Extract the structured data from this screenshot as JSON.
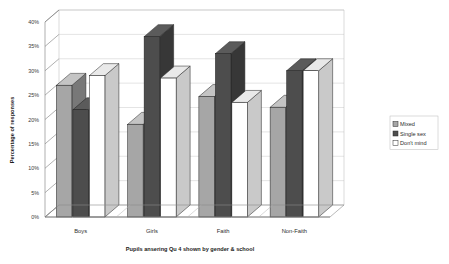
{
  "chart_data": {
    "type": "bar",
    "title": "",
    "xlabel": "Pupils ansering Qu 4 shown by gender & school",
    "ylabel": "Percentage of responses",
    "categories": [
      "Boys",
      "Girls",
      "Faith",
      "Non-Faith"
    ],
    "series": [
      {
        "name": "Mixed",
        "values": [
          27.0,
          19.0,
          24.7,
          22.5
        ],
        "color": "#a6a6a6"
      },
      {
        "name": "Single sex",
        "values": [
          22.0,
          37.0,
          33.5,
          30.0
        ],
        "color": "#4d4d4d"
      },
      {
        "name": "Don't mind",
        "values": [
          29.0,
          28.5,
          23.5,
          30.0
        ],
        "color": "#ffffff"
      }
    ],
    "ylim": [
      0,
      40
    ],
    "ytick_values": [
      0,
      5,
      10,
      15,
      20,
      25,
      30,
      35,
      40
    ],
    "ytick_labels": [
      "0%",
      "5%",
      "10%",
      "15%",
      "20%",
      "25%",
      "30%",
      "35%",
      "40%"
    ],
    "grid": true,
    "legend_position": "right",
    "style": "3d-column",
    "plot_background": "#ffffff",
    "gridline_color": "#c8c8c8",
    "axis_color": "#7a7a7a"
  },
  "legend": {
    "items": [
      {
        "label": "Mixed",
        "swatch": "#a6a6a6"
      },
      {
        "label": "Single sex",
        "swatch": "#4d4d4d"
      },
      {
        "label": "Don't mind",
        "swatch": "#ffffff"
      }
    ]
  }
}
